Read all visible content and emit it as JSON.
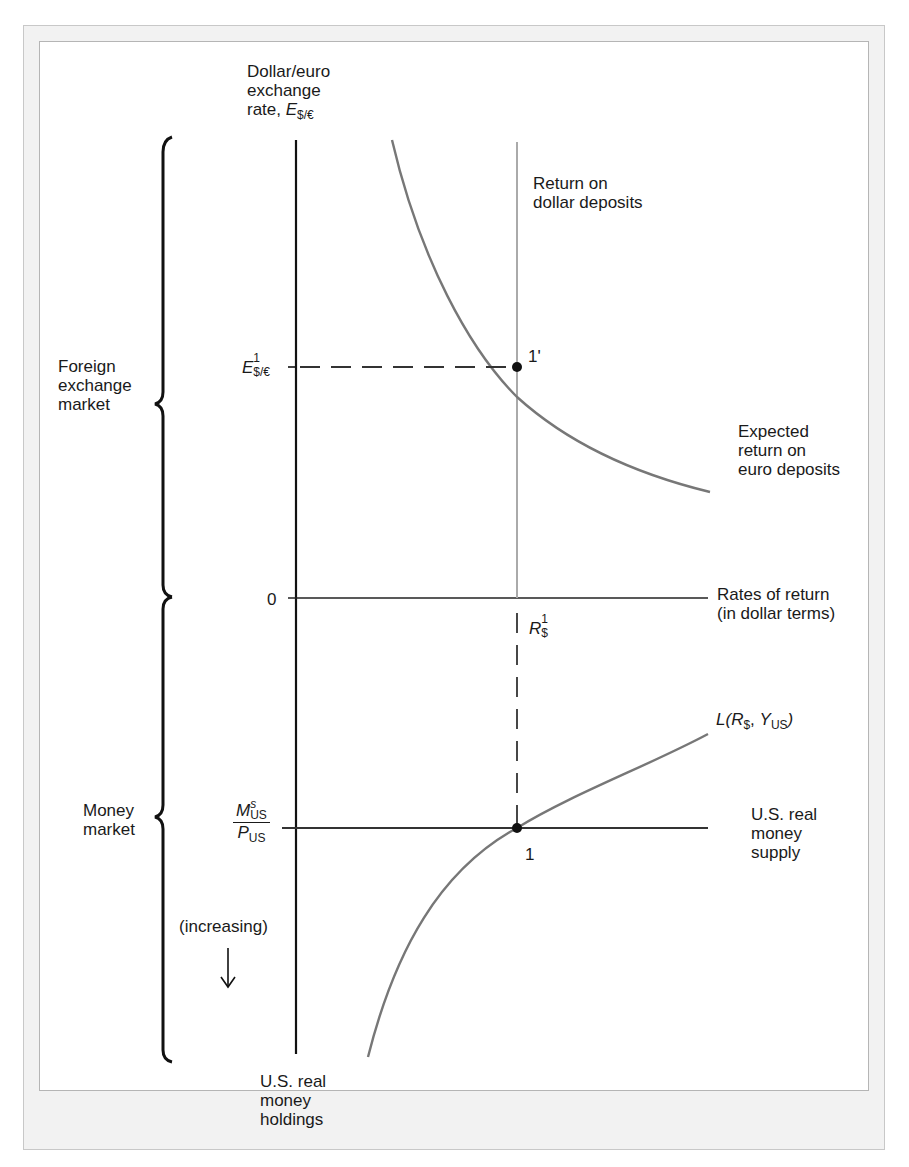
{
  "figure": {
    "y_axis_title": [
      "Dollar/euro",
      "exchange",
      "rate, "
    ],
    "y_axis_symbol": {
      "main": "E",
      "sub": "$/€"
    },
    "x_axis_label": [
      "Rates of return",
      "(in dollar terms)"
    ],
    "lower_axis_label": [
      "U.S. real",
      "money",
      "holdings"
    ],
    "origin_label": "0",
    "increasing_label": "(increasing)",
    "increasing_arrow": "↓",
    "brackets": {
      "top": [
        "Foreign",
        "exchange",
        "market"
      ],
      "bottom": [
        "Money",
        "market"
      ]
    },
    "curves": {
      "dollar_return": [
        "Return on",
        "dollar deposits"
      ],
      "euro_return": [
        "Expected",
        "return on",
        "euro deposits"
      ],
      "money_demand": {
        "prefix": "L(",
        "r": "R",
        "r_sub": "$",
        "sep": ", ",
        "y": "Y",
        "y_sub": "US",
        "suffix": ")"
      },
      "money_supply": [
        "U.S. real",
        "money",
        "supply"
      ]
    },
    "ticks": {
      "exchange_rate": {
        "main": "E",
        "sup": "1",
        "sub": "$/€"
      },
      "interest_rate": {
        "main": "R",
        "sup": "1",
        "sub": "$"
      },
      "money_supply_num": {
        "main": "M",
        "sup": "s",
        "sub": "US"
      },
      "money_supply_den": {
        "main": "P",
        "sub": "US"
      }
    },
    "points": {
      "fx_equilibrium": "1'",
      "money_equilibrium": "1"
    },
    "colors": {
      "axis": "#111111",
      "curve": "#777777",
      "dollar_line": "#aaaaaa",
      "dashed": "#333333",
      "frame_outer": "#f2f2f2",
      "frame_border": "#b5b5b5"
    }
  }
}
